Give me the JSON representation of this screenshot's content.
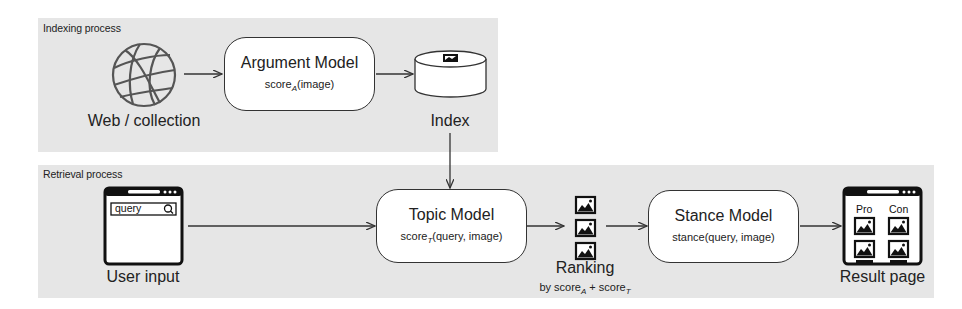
{
  "indexing": {
    "label": "Indexing process",
    "source": {
      "icon": "globe-icon",
      "label": "Web / collection"
    },
    "argument_model": {
      "title": "Argument Model",
      "func": "score",
      "func_sub": "A",
      "func_args": "(image)"
    },
    "index": {
      "icon": "database-cylinder-icon",
      "label": "Index"
    }
  },
  "retrieval": {
    "label": "Retrieval process",
    "user_input": {
      "icon": "browser-window-icon",
      "query_text": "query",
      "search_icon": "magnifier-icon",
      "label": "User input"
    },
    "topic_model": {
      "title": "Topic Model",
      "func": "score",
      "func_sub": "T",
      "func_args": "(query, image)"
    },
    "ranking": {
      "icon": "image-stack-icon",
      "label": "Ranking",
      "sub_prefix": "by score",
      "sub_a": "A",
      "sub_plus": " + score",
      "sub_t": "T"
    },
    "stance_model": {
      "title": "Stance Model",
      "func": "stance(query, image)"
    },
    "result_page": {
      "icon": "browser-window-icon",
      "col_pro": "Pro",
      "col_con": "Con",
      "label": "Result page"
    }
  },
  "colors": {
    "region_bg": "#e6e6e6",
    "stroke": "#333333",
    "box_fill": "#ffffff"
  }
}
